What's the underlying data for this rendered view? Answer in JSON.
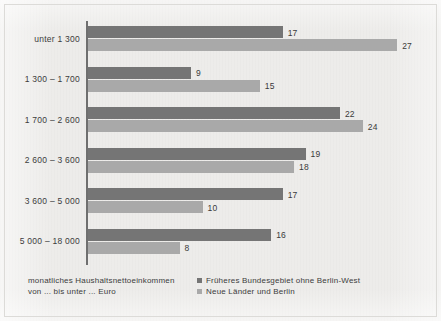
{
  "chart_data": {
    "type": "bar",
    "orientation": "horizontal",
    "grouped": true,
    "title": "",
    "xlabel": "",
    "ylabel": "",
    "categories": [
      "unter 1 300",
      "1 300 – 1 700",
      "1 700 – 2 600",
      "2 600 – 3 600",
      "3 600 – 5 000",
      "5 000 – 18 000"
    ],
    "series": [
      {
        "name": "Früheres Bundesgebiet ohne Berlin-West",
        "color": "#757575",
        "values": [
          17,
          9,
          22,
          19,
          17,
          16
        ]
      },
      {
        "name": "Neue Länder und Berlin",
        "color": "#a9a9a9",
        "values": [
          27,
          15,
          24,
          18,
          10,
          8
        ]
      }
    ],
    "xlim": [
      0,
      30
    ],
    "grid": false,
    "legend_position": "bottom-right",
    "value_labels": true,
    "axis_color": "#6f6f6f",
    "background_color": "#edecea"
  },
  "caption": {
    "line1": "monatliches Haushaltsnettoeinkommen",
    "line2": "von ... bis unter ... Euro"
  },
  "legend": {
    "items": [
      {
        "label": "Früheres Bundesgebiet ohne Berlin-West"
      },
      {
        "label": "Neue Länder und Berlin"
      }
    ]
  }
}
